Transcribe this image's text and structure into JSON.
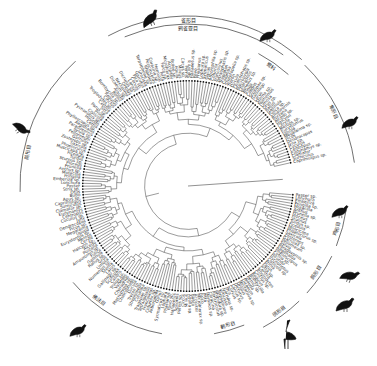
{
  "figure": {
    "type": "circular-phylogenetic-tree",
    "center": [
      188,
      186
    ],
    "tip_count": 220,
    "tip_radius": 104,
    "label_radius_min": 108,
    "label_radius_max": 150,
    "root_gap_start_deg": -12,
    "root_gap_end_deg": 4,
    "colors": {
      "line": "#222222",
      "label": "#444444",
      "label_light": "#9a9a9a",
      "bird": "#111111"
    }
  },
  "clades": [
    {
      "name": "雀形目",
      "label": "雀形目",
      "arc_radius": 170,
      "start_deg": -118,
      "end_deg": -48,
      "label_deg": -90
    },
    {
      "name": "鸦雀亚目",
      "label": "鸦雀亚目",
      "arc_radius": 162,
      "start_deg": -113,
      "end_deg": -54,
      "label_deg": -90
    },
    {
      "name": "鹭科",
      "label": "鹭科",
      "arc_radius": 150,
      "start_deg": -62,
      "end_deg": -48,
      "label_deg": -55
    },
    {
      "name": "隼形目",
      "label": "隼形目",
      "arc_radius": 168,
      "start_deg": -46,
      "end_deg": -8,
      "label_deg": -27
    },
    {
      "name": "鸡形目",
      "label": "鸡形目",
      "arc_radius": 160,
      "start_deg": 8,
      "end_deg": 22,
      "label_deg": 16
    },
    {
      "name": "鸽形目",
      "label": "鸽形目",
      "arc_radius": 160,
      "start_deg": 26,
      "end_deg": 42,
      "label_deg": 34
    },
    {
      "name": "鸻形目",
      "label": "鸻形目",
      "arc_radius": 160,
      "start_deg": 46,
      "end_deg": 62,
      "label_deg": 54
    },
    {
      "name": "鹤形目",
      "label": "鹤形目",
      "arc_radius": 150,
      "start_deg": 68,
      "end_deg": 80,
      "label_deg": 74
    },
    {
      "name": "佛法目",
      "label": "佛法目",
      "arc_radius": 150,
      "start_deg": 100,
      "end_deg": 140,
      "label_deg": 128
    },
    {
      "name": "鹃形目",
      "label": "鹃形目",
      "arc_radius": 168,
      "start_deg": 178,
      "end_deg": 228,
      "label_deg": 192
    }
  ],
  "birds": [
    {
      "name": "passerine-bird-icon",
      "x": 150,
      "y": 18,
      "rot": -20,
      "scale": 1.0
    },
    {
      "name": "wagtail-bird-icon",
      "x": 268,
      "y": 35,
      "rot": 0,
      "scale": 0.9
    },
    {
      "name": "songbird-icon",
      "x": 350,
      "y": 122,
      "rot": 0,
      "scale": 0.9
    },
    {
      "name": "pheasant-bird-icon",
      "x": 340,
      "y": 211,
      "rot": 0,
      "scale": 0.9
    },
    {
      "name": "pigeon-bird-icon",
      "x": 350,
      "y": 275,
      "rot": 20,
      "scale": 0.95
    },
    {
      "name": "plover-bird-icon",
      "x": 345,
      "y": 304,
      "rot": 0,
      "scale": 1.0
    },
    {
      "name": "crane-bird-icon",
      "x": 285,
      "y": 335,
      "rot": 0,
      "scale": 1.0
    },
    {
      "name": "roller-bird-icon",
      "x": 78,
      "y": 330,
      "rot": 0,
      "scale": 0.9
    },
    {
      "name": "cuckoo-bird-icon",
      "x": 22,
      "y": 128,
      "rot": 60,
      "scale": 0.9
    }
  ],
  "sample_tip_labels": [
    "Passer",
    "Lonchura",
    "Emberiza",
    "Fringilla",
    "Motacilla",
    "Anthus",
    "Prunella",
    "Ploceus",
    "Sturnus",
    "Turdus",
    "Ficedula",
    "Muscicapa",
    "Phoenicurus",
    "Saxicola",
    "Zosterops",
    "Garrulax",
    "Pellorneum",
    "Sylvia",
    "Paradoxornis",
    "Aegithalos",
    "Phylloscopus",
    "Cettia",
    "Hirundo",
    "Pycnonotus",
    "Cisticola",
    "Prinia",
    "Parus",
    "Sitta",
    "Certhia",
    "Troglodytes",
    "Cinclus",
    "Regulus",
    "Bombycilla",
    "Remiz",
    "Alauda",
    "Dicaeum",
    "Nectarinia",
    "Oriolus",
    "Dicrurus",
    "Lanius",
    "Corvus",
    "Pica",
    "Garrulus",
    "Urocissa",
    "Terpsiphone",
    "Rhipidura",
    "Pericrocotus",
    "Coracina",
    "Hemixos",
    "Pitta",
    "Falco",
    "Microhierax",
    "Accipiter",
    "Buteo",
    "Aquila",
    "Milvus",
    "Circus",
    "Pernis",
    "Spilornis",
    "Haliaeetus",
    "Pavo",
    "Phasianus",
    "Lophura",
    "Syrmaticus",
    "Gallus",
    "Arborophila",
    "Coturnix",
    "Francolinus",
    "Tetraophasis",
    "Tragopan",
    "Columba",
    "Streptopelia",
    "Treron",
    "Ducula",
    "Chalcophaps",
    "Macropygia",
    "Charadrius",
    "Vanellus",
    "Tringa",
    "Calidris",
    "Scolopax",
    "Gallinago",
    "Larus",
    "Sterna",
    "Numenius",
    "Limosa",
    "Grus",
    "Rallus",
    "Gallinula",
    "Fulica",
    "Amaurornis",
    "Porzana",
    "Alcedo",
    "Halcyon",
    "Ceryle",
    "Merops",
    "Eurystomus",
    "Upupa",
    "Megalaima",
    "Picus",
    "Dendrocopos",
    "Jynx",
    "Cuculus",
    "Centropus",
    "Eudynamys",
    "Clamator",
    "Surniculus",
    "Caprimulgus",
    "Apus",
    "Bubo",
    "Otus",
    "Strix"
  ],
  "caption": {
    "title": "雀形目",
    "subtitle": "鸦雀亚目"
  }
}
